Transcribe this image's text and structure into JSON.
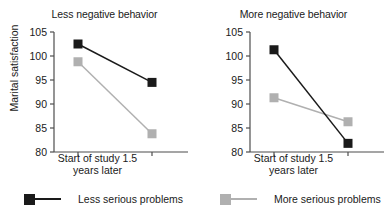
{
  "figure": {
    "ylabel": "Marital satisfaction",
    "x_tick_labels": [
      "Start of study",
      "1.5",
      "years later"
    ],
    "x_axis_line1": "Start of study 1.5",
    "x_axis_line2": "years later"
  },
  "colors": {
    "series_black": "#1a1a1a",
    "series_gray": "#b0b0b0",
    "axis": "#4d4d4d",
    "background": "#ffffff"
  },
  "legend": {
    "entries": [
      {
        "label": "Less serious problems",
        "color": "#1a1a1a",
        "marker": "square"
      },
      {
        "label": "More serious problems",
        "color": "#b0b0b0",
        "marker": "square"
      }
    ]
  },
  "chart_data": [
    {
      "type": "line",
      "title": "Less negative behavior",
      "xlabel": "",
      "ylabel": "Marital satisfaction",
      "x": [
        "Start of study",
        "1.5 years later"
      ],
      "categories": [
        "Start of study",
        "1.5 years later"
      ],
      "ylim": [
        80,
        105
      ],
      "yticks": [
        80,
        85,
        90,
        95,
        100,
        105
      ],
      "grid": false,
      "legend_position": "below",
      "series": [
        {
          "name": "Less serious problems",
          "color": "#1a1a1a",
          "values": [
            102.5,
            94.5
          ]
        },
        {
          "name": "More serious problems",
          "color": "#b0b0b0",
          "values": [
            98.8,
            83.8
          ]
        }
      ]
    },
    {
      "type": "line",
      "title": "More negative behavior",
      "xlabel": "",
      "ylabel": "Marital satisfaction",
      "x": [
        "Start of study",
        "1.5 years later"
      ],
      "categories": [
        "Start of study",
        "1.5 years later"
      ],
      "ylim": [
        80,
        105
      ],
      "yticks": [
        80,
        85,
        90,
        95,
        100,
        105
      ],
      "grid": false,
      "legend_position": "below",
      "series": [
        {
          "name": "Less serious problems",
          "color": "#1a1a1a",
          "values": [
            101.3,
            81.8
          ]
        },
        {
          "name": "More serious problems",
          "color": "#b0b0b0",
          "values": [
            91.3,
            86.3
          ]
        }
      ]
    }
  ]
}
